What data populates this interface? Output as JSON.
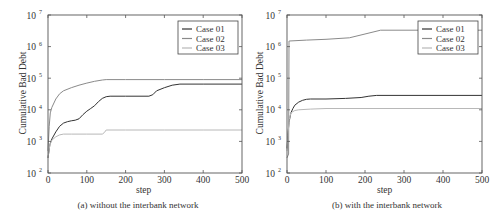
{
  "chart_data": [
    {
      "id": "a",
      "type": "line",
      "caption": "(a) without the interbank network",
      "xlabel": "step",
      "ylabel": "Cumulative Bad Debt",
      "yscale": "log",
      "xlim": [
        0,
        500
      ],
      "ylim": [
        100,
        10000000
      ],
      "xticks": [
        "0",
        "100",
        "200",
        "300",
        "400",
        "500"
      ],
      "yticks": [
        "10^2",
        "10^3",
        "10^4",
        "10^5",
        "10^6",
        "10^7"
      ],
      "grid": false,
      "legend": {
        "position": "upper right",
        "entries": [
          "Case 01",
          "Case 02",
          "Case 03"
        ]
      },
      "series": [
        {
          "name": "Case 01",
          "color": "#333333",
          "x": [
            0,
            5,
            10,
            20,
            30,
            40,
            50,
            60,
            70,
            80,
            90,
            100,
            110,
            120,
            130,
            140,
            150,
            160,
            200,
            260,
            270,
            280,
            300,
            320,
            340,
            400,
            500
          ],
          "y": [
            300,
            800,
            1200,
            2000,
            3000,
            3800,
            4200,
            4500,
            4700,
            5200,
            7000,
            9000,
            11000,
            13500,
            18000,
            23000,
            26000,
            27000,
            27000,
            27000,
            30000,
            40000,
            50000,
            60000,
            65000,
            65000,
            65000
          ]
        },
        {
          "name": "Case 02",
          "color": "#8a8a8a",
          "x": [
            0,
            3,
            6,
            10,
            20,
            30,
            40,
            60,
            80,
            100,
            120,
            140,
            150,
            200,
            300,
            400,
            500
          ],
          "y": [
            500,
            3000,
            8000,
            12000,
            22000,
            32000,
            40000,
            50000,
            60000,
            70000,
            80000,
            88000,
            90000,
            90000,
            90000,
            90000,
            90000
          ]
        },
        {
          "name": "Case 03",
          "color": "#b8b8b8",
          "x": [
            0,
            5,
            10,
            20,
            30,
            40,
            60,
            100,
            140,
            145,
            150,
            200,
            300,
            400,
            500
          ],
          "y": [
            300,
            800,
            1100,
            1400,
            1600,
            1700,
            1700,
            1700,
            1700,
            1900,
            2300,
            2300,
            2300,
            2300,
            2300
          ]
        }
      ]
    },
    {
      "id": "b",
      "type": "line",
      "caption": "(b) with the interbank network",
      "xlabel": "step",
      "ylabel": "Cumulative Bad Debt",
      "yscale": "log",
      "xlim": [
        0,
        500
      ],
      "ylim": [
        100,
        10000000
      ],
      "xticks": [
        "0",
        "100",
        "200",
        "300",
        "400",
        "500"
      ],
      "yticks": [
        "10^2",
        "10^3",
        "10^4",
        "10^5",
        "10^6",
        "10^7"
      ],
      "grid": false,
      "legend": {
        "position": "upper right",
        "entries": [
          "Case 01",
          "Case 02",
          "Case 03"
        ]
      },
      "series": [
        {
          "name": "Case 01",
          "color": "#333333",
          "x": [
            0,
            2,
            5,
            10,
            15,
            20,
            30,
            40,
            50,
            60,
            100,
            150,
            190,
            210,
            230,
            300,
            400,
            500
          ],
          "y": [
            600,
            1500,
            4000,
            8000,
            11000,
            14000,
            17500,
            20000,
            21500,
            22000,
            22000,
            23000,
            24500,
            27000,
            28500,
            28500,
            28500,
            28500
          ]
        },
        {
          "name": "Case 02",
          "color": "#8a8a8a",
          "x": [
            0,
            4,
            5,
            6,
            50,
            100,
            160,
            200,
            240,
            300,
            400,
            500
          ],
          "y": [
            300,
            400,
            1500000,
            1500000,
            1600000,
            1700000,
            1900000,
            2500000,
            3300000,
            3300000,
            3300000,
            3300000
          ]
        },
        {
          "name": "Case 03",
          "color": "#b8b8b8",
          "x": [
            0,
            3,
            6,
            10,
            20,
            30,
            60,
            100,
            200,
            300,
            400,
            500
          ],
          "y": [
            500,
            2000,
            5000,
            8000,
            9500,
            10000,
            10500,
            11000,
            11000,
            11000,
            11000,
            11000
          ]
        }
      ]
    }
  ]
}
